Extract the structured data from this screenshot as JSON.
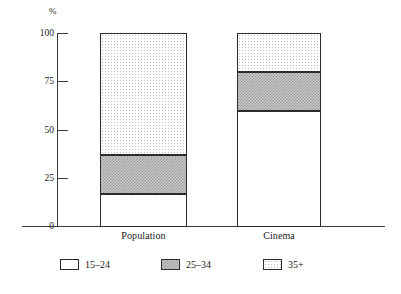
{
  "chart_data": {
    "type": "bar",
    "subtype": "stacked-bar",
    "title": "",
    "xlabel": "",
    "ylabel": "%",
    "unit_label": "%",
    "ylim": [
      0,
      100
    ],
    "yticks": [
      0,
      25,
      50,
      75,
      100
    ],
    "ytick_labels": [
      "0",
      "25",
      "50",
      "75",
      "100"
    ],
    "grid": false,
    "legend_position": "bottom",
    "categories": [
      "Population",
      "Cinema"
    ],
    "series": [
      {
        "name": "15–24",
        "values": [
          17,
          60
        ],
        "fill": "white"
      },
      {
        "name": "25–34",
        "values": [
          20,
          20
        ],
        "fill": "gray"
      },
      {
        "name": "35+",
        "values": [
          63,
          20
        ],
        "fill": "dots"
      }
    ],
    "cumulative_boundaries": {
      "Population": [
        0,
        17,
        37,
        100
      ],
      "Cinema": [
        0,
        60,
        80,
        100
      ]
    }
  },
  "legend": {
    "items": [
      {
        "label": "15–24",
        "swatch": "white"
      },
      {
        "label": "25–34",
        "swatch": "gray"
      },
      {
        "label": "35+",
        "swatch": "dots"
      }
    ]
  },
  "axis": {
    "unit": "%",
    "ticks": [
      "100",
      "75",
      "50",
      "25",
      "0"
    ]
  },
  "categories": {
    "population": "Population",
    "cinema": "Cinema"
  }
}
